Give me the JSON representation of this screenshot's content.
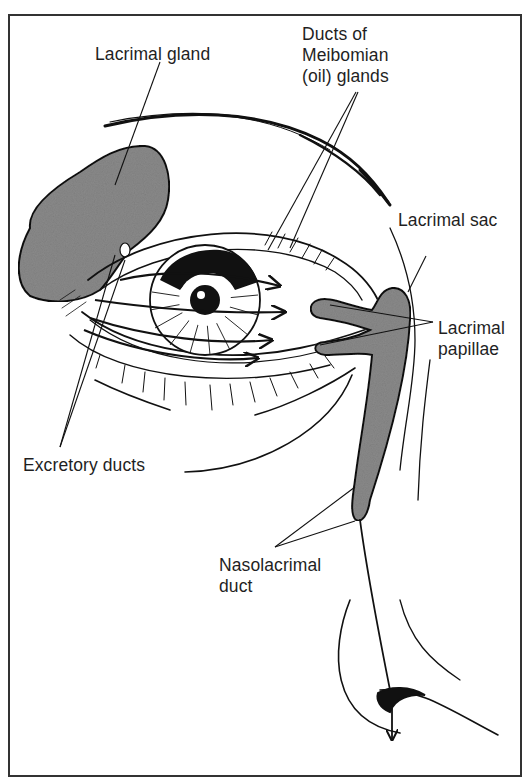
{
  "figure": {
    "labels": {
      "lacrimal_gland": "Lacrimal gland",
      "meibomian": "Ducts of\nMeibomian\n(oil) glands",
      "lacrimal_sac": "Lacrimal sac",
      "lacrimal_papillae": "Lacrimal\npapillae",
      "excretory_ducts": "Excretory ducts",
      "nasolacrimal_duct": "Nasolacrimal\nduct"
    },
    "colors": {
      "gland_fill": "#8a8a8a",
      "ink": "#111111",
      "border": "#333333",
      "background": "#ffffff"
    }
  }
}
